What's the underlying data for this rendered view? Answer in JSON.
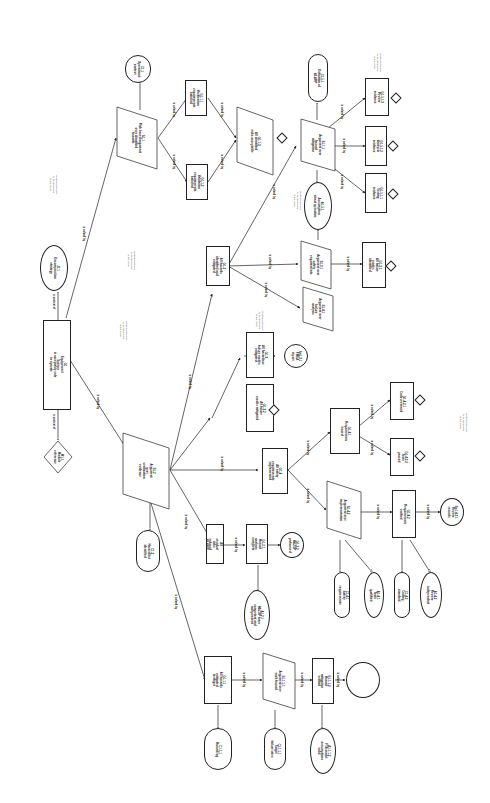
{
  "diagram": {
    "orientation": "rotated 90 degrees clockwise",
    "edge_labels": {
      "solved": "is solved by",
      "context": "is context of"
    },
    "notes": [
      {
        "id": "note1",
        "text": "Undeveloped goal\nto be developed\nin the future"
      },
      {
        "id": "note2",
        "text": "Undeveloped goal\nto be developed\nin the future"
      },
      {
        "id": "note3",
        "text": "Undeveloped goal\nto be developed\nin the future"
      },
      {
        "id": "note4",
        "text": "Undeveloped goal\nto be developed\nin the future"
      },
      {
        "id": "note5",
        "text": "Undeveloped goal\nto be developed\nin the future"
      },
      {
        "id": "note6",
        "text": "Undeveloped goal\nto be developed\nin the future"
      },
      {
        "id": "note7",
        "text": "Undeveloped goal\nto be developed\nin the future"
      }
    ],
    "nodes": [
      {
        "id": "J1",
        "type": "justification",
        "label": "J1.1\nDecomposition\nstrategy",
        "tag": "Justification"
      },
      {
        "id": "G1",
        "type": "goal",
        "label": "G1\nEquipment / System\nis acceptably safe\nto operate",
        "tag": "GSN"
      },
      {
        "id": "M1",
        "type": "goal",
        "label": "M1.1\nModule\nreference",
        "tag": "Away"
      },
      {
        "id": "C1",
        "type": "context",
        "label": "C1.1\nOperational\ncontext",
        "tag": "Context"
      },
      {
        "id": "S1",
        "type": "strategy",
        "label": "S1.1\nRisk based argument\nover identified\nhazards",
        "tag": "Strategy"
      },
      {
        "id": "S2",
        "type": "strategy",
        "label": "S1.2\nArgument\nover\nverification\nevidence",
        "tag": "Strategy"
      },
      {
        "id": "C2",
        "type": "context",
        "label": "C1.2\nHazard list\nidentified",
        "tag": "Context"
      },
      {
        "id": "G11",
        "type": "goal",
        "label": "G1.1.1\nVerification\nrequirements\nsatisfied",
        "tag": ""
      },
      {
        "id": "G12",
        "type": "goal",
        "label": "G1.1.2\nValidation\nrequirements\nsatisfied",
        "tag": ""
      },
      {
        "id": "G13",
        "type": "goal",
        "label": "G1.1.3\nAll identified\nrisks acceptable",
        "tag": ""
      },
      {
        "id": "G21",
        "type": "goal",
        "label": "G1.2\nAll hazards\nidentified and\nmitigated",
        "tag": ""
      },
      {
        "id": "G22",
        "type": "goal",
        "label": "G1.3\nAll hazardous\nfailure modes\nmitigated",
        "tag": ""
      },
      {
        "id": "G23",
        "type": "goal",
        "label": "G1.4\nAll safety\nrequirements\nimplemented",
        "tag": ""
      },
      {
        "id": "G24",
        "type": "goal",
        "label": "G1.5\nAll residual\nrisks reduced\nALARP",
        "tag": ""
      },
      {
        "id": "S3",
        "type": "strategy",
        "label": "S1.3.1\nArgument over\nsafety\nrequirements",
        "tag": "Strategy"
      },
      {
        "id": "S4",
        "type": "strategy",
        "label": "S1.4.1\nArgument over\nfailure\nanalysis",
        "tag": "Strategy"
      },
      {
        "id": "S5",
        "type": "strategy",
        "label": "S1.1.1\nArgument over\nhazard\nmitigation",
        "tag": "Strategy"
      },
      {
        "id": "S6",
        "type": "strategy",
        "label": "S1.5.1\nArgument over\nindependent\nassessment",
        "tag": "Strategy"
      },
      {
        "id": "A1",
        "type": "assumption",
        "label": "A1.5.1\nAssumption\nabout operation",
        "tag": "Assumption"
      },
      {
        "id": "C3",
        "type": "context",
        "label": "C1.5.1\nDefinition of\nALARP",
        "tag": "Context"
      },
      {
        "id": "G31",
        "type": "goal",
        "label": "G1.5.1.1\nTesting\nevidence",
        "tag": ""
      },
      {
        "id": "G32",
        "type": "goal",
        "label": "G1.5.1.2\nAnalysis\nevidence",
        "tag": ""
      },
      {
        "id": "G33",
        "type": "goal",
        "label": "G1.5.1.3\nReview\nevidence",
        "tag": ""
      },
      {
        "id": "G41",
        "type": "goal",
        "label": "G1.3.1\nAll failure\nmodes identified",
        "tag": ""
      },
      {
        "id": "G42",
        "type": "goal",
        "label": "G1.3.2\nAll failure\nmodes mitigated",
        "tag": ""
      },
      {
        "id": "Sn1",
        "type": "solution",
        "label": "Sn1.3.1\nFMEA\nreport",
        "tag": "Solution"
      },
      {
        "id": "G51",
        "type": "goal",
        "label": "G1.4.1\nRequirements\ntraced",
        "tag": ""
      },
      {
        "id": "G52",
        "type": "goal",
        "label": "G1.4.2\nRequirements\nverified",
        "tag": ""
      },
      {
        "id": "S7",
        "type": "strategy",
        "label": "S1.4.2\nArgument over\nimplementation",
        "tag": "Strategy"
      },
      {
        "id": "G53",
        "type": "goal",
        "label": "G1.4.2.1\nCode reviewed",
        "tag": ""
      },
      {
        "id": "G54",
        "type": "goal",
        "label": "G1.4.2.2\nTests\npassed",
        "tag": ""
      },
      {
        "id": "C4",
        "type": "context",
        "label": "C1.4.1\nSafety\nrequirements",
        "tag": "Context"
      },
      {
        "id": "A2",
        "type": "assumption",
        "label": "A1.4.1\nTools\nqualified",
        "tag": "Assumption"
      },
      {
        "id": "C5",
        "type": "context",
        "label": "C1.4.2\nCoding\nstandard",
        "tag": "Context"
      },
      {
        "id": "A3",
        "type": "assumption",
        "label": "A1.4.2\nReview\nindependent",
        "tag": "Assumption"
      },
      {
        "id": "Sn2",
        "type": "solution",
        "label": "Sn1.4.2.1\nReview\nrecords",
        "tag": "Solution"
      },
      {
        "id": "G61",
        "type": "goal",
        "label": "G1.2.1\nHazard analysis\ncomplete",
        "tag": ""
      },
      {
        "id": "G62",
        "type": "goal",
        "label": "G1.2.2\nHAZOP\nperformed",
        "tag": ""
      },
      {
        "id": "Sn3",
        "type": "solution",
        "label": "Sn1.2.2\nHAZOP\nreport",
        "tag": "Solution"
      },
      {
        "id": "A4",
        "type": "assumption",
        "label": "A1.2.1\nHAZOP team\ncompetent and\nindependent",
        "tag": "Assumption"
      },
      {
        "id": "C6",
        "type": "context",
        "label": "C1.2.1\nSystem\ndefinition",
        "tag": "Context"
      },
      {
        "id": "G71",
        "type": "goal",
        "label": "G1.1.1\nAll hazards\nmitigated\nto target",
        "tag": ""
      },
      {
        "id": "S8",
        "type": "strategy",
        "label": "S1.1.1.1\nArgument over\neach hazard",
        "tag": "Strategy"
      },
      {
        "id": "G72",
        "type": "goal",
        "label": "G1.1.1.2\nHazard\nmitigation\nverified",
        "tag": ""
      },
      {
        "id": "C7",
        "type": "context",
        "label": "C1.1.1\nHazard log",
        "tag": "Context"
      },
      {
        "id": "C8",
        "type": "context",
        "label": "C1.1.1.1\nTarget\nfailure rates",
        "tag": "Context"
      },
      {
        "id": "A5",
        "type": "assumption",
        "label": "A1.1.1.2\nFTA model\nassumptions\nvalid",
        "tag": "Assumption"
      },
      {
        "id": "Sn4",
        "type": "solution",
        "label": "Sn1.1.1.2\nFault Tree\nAnalysis",
        "tag": "Solution"
      }
    ]
  }
}
